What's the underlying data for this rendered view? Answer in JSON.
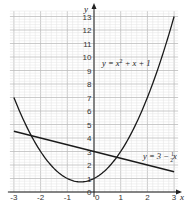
{
  "chart_data": {
    "type": "line",
    "title": "",
    "xlabel": "x",
    "ylabel": "y",
    "xlim": [
      -3,
      3
    ],
    "ylim": [
      0,
      13
    ],
    "grid": true,
    "x_ticks": [
      "-3",
      "-2",
      "-1",
      "0",
      "1",
      "2",
      "3"
    ],
    "y_ticks": [
      "0",
      "1",
      "2",
      "3",
      "4",
      "5",
      "6",
      "7",
      "8",
      "9",
      "10",
      "11",
      "12",
      "13"
    ],
    "series": [
      {
        "name": "y = x² + x + 1",
        "label_text": "y = x² + x + 1",
        "x": [
          -3,
          -2.5,
          -2,
          -1.5,
          -1,
          -0.5,
          0,
          0.5,
          1,
          1.5,
          2,
          2.5,
          3
        ],
        "values": [
          7,
          4.75,
          3,
          1.75,
          1,
          0.75,
          1,
          1.75,
          3,
          4.75,
          7,
          9.75,
          13
        ]
      },
      {
        "name": "y = 3 − ½x",
        "label_text": "y = 3 − ½x",
        "x": [
          -3,
          3
        ],
        "values": [
          4.5,
          1.5
        ]
      }
    ],
    "annotations": [
      "y = x² + x + 1",
      "y = 3 − ½x"
    ]
  },
  "labels": {
    "x_axis": "x",
    "y_axis": "y",
    "curve_label_prefix": "y = x",
    "curve_label_sup": "2",
    "curve_label_suffix": " + x + 1",
    "line_label_prefix": "y = 3 − ",
    "line_label_frac_num": "1",
    "line_label_frac_den": "2",
    "line_label_suffix": "x"
  }
}
